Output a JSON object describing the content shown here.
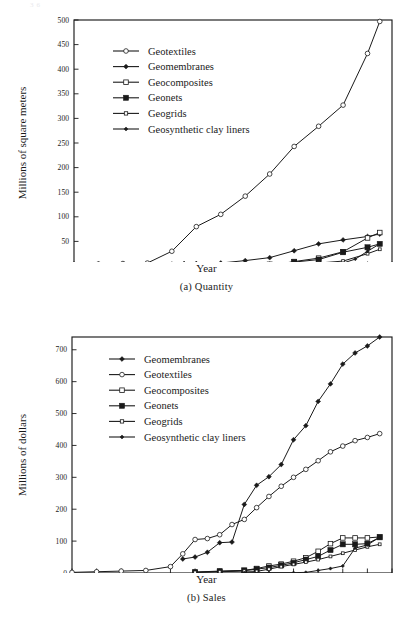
{
  "page": {
    "top_stub": "36",
    "background": "#ffffff",
    "ink": "#1a1a1a"
  },
  "figures": [
    {
      "id": "quantity",
      "caption": "(a)  Quantity",
      "xlabel": "Year",
      "ylabel": "Millions of square meters",
      "legend": [
        {
          "label": "Geotextiles",
          "marker": "open-circle",
          "size": 4.0
        },
        {
          "label": "Geomembranes",
          "marker": "filled-diamond",
          "size": 3.4
        },
        {
          "label": "Geocomposites",
          "marker": "open-square",
          "size": 3.8
        },
        {
          "label": "Geonets",
          "marker": "filled-square",
          "size": 4.2
        },
        {
          "label": "Geogrids",
          "marker": "open-square",
          "size": 2.8
        },
        {
          "label": "Geosynthetic clay liners",
          "marker": "filled-diamond",
          "size": 2.8
        }
      ],
      "chart_data": {
        "type": "line",
        "title": "(a)  Quantity",
        "xlabel": "Year",
        "ylabel": "Millions of square meters",
        "xlim": [
          1970,
          1996
        ],
        "ylim": [
          0,
          500
        ],
        "xticks": [
          1970,
          1972,
          1974,
          1976,
          1978,
          1980,
          1982,
          1984,
          1986,
          1988,
          1990,
          1992,
          1994,
          1996
        ],
        "yticks": [
          0,
          50,
          100,
          150,
          200,
          250,
          300,
          350,
          400,
          450,
          500
        ],
        "grid": false,
        "legend_position": "upper-left",
        "series": [
          {
            "name": "Geotextiles",
            "marker": "open-circle",
            "x": [
              1970,
              1972,
              1974,
              1976,
              1978,
              1980,
              1982,
              1984,
              1986,
              1988,
              1990,
              1992,
              1994,
              1995
            ],
            "y": [
              3,
              4,
              5,
              6,
              30,
              80,
              105,
              142,
              187,
              243,
              284,
              327,
              432,
              497
            ]
          },
          {
            "name": "Geomembranes",
            "marker": "filled-diamond",
            "x": [
              1979,
              1980,
              1982,
              1984,
              1986,
              1988,
              1990,
              1992,
              1994,
              1995
            ],
            "y": [
              5,
              5,
              6,
              11,
              17,
              31,
              45,
              53,
              60,
              65
            ]
          },
          {
            "name": "Geocomposites",
            "marker": "open-square",
            "x": [
              1985,
              1986,
              1988,
              1990,
              1992,
              1994,
              1995
            ],
            "y": [
              1,
              1,
              9,
              16,
              29,
              57,
              68
            ]
          },
          {
            "name": "Geonets",
            "marker": "filled-square",
            "x": [
              1985,
              1986,
              1988,
              1990,
              1992,
              1994,
              1995
            ],
            "y": [
              1,
              3,
              8,
              13,
              28,
              38,
              45
            ]
          },
          {
            "name": "Geogrids",
            "marker": "open-square-small",
            "x": [
              1985,
              1986,
              1988,
              1990,
              1992,
              1994,
              1995
            ],
            "y": [
              1,
              1,
              3,
              6,
              10,
              25,
              34
            ]
          },
          {
            "name": "Geosynthetic clay liners",
            "marker": "filled-diamond-small",
            "x": [
              1986,
              1988,
              1990,
              1992,
              1993,
              1994,
              1995
            ],
            "y": [
              1,
              1,
              2,
              6,
              14,
              30,
              45
            ]
          }
        ]
      }
    },
    {
      "id": "sales",
      "caption": "(b) Sales",
      "xlabel": "Year",
      "ylabel": "Millions of dollars",
      "legend": [
        {
          "label": "Geomembranes",
          "marker": "filled-diamond",
          "size": 3.4
        },
        {
          "label": "Geotextiles",
          "marker": "open-circle",
          "size": 4.0
        },
        {
          "label": "Geocomposites",
          "marker": "open-square",
          "size": 3.8
        },
        {
          "label": "Geonets",
          "marker": "filled-square",
          "size": 4.2
        },
        {
          "label": "Geogrids",
          "marker": "open-square",
          "size": 2.8
        },
        {
          "label": "Geosynthetic clay liners",
          "marker": "filled-diamond",
          "size": 2.8
        }
      ],
      "chart_data": {
        "type": "line",
        "title": "(b) Sales",
        "xlabel": "Year",
        "ylabel": "Millions of dollars",
        "xlim": [
          1970,
          1996
        ],
        "ylim": [
          0,
          740
        ],
        "xticks": [
          1970,
          1972,
          1974,
          1976,
          1978,
          1980,
          1982,
          1984,
          1986,
          1988,
          1990,
          1992,
          1994,
          1996
        ],
        "yticks": [
          0,
          100,
          200,
          300,
          400,
          500,
          600,
          700
        ],
        "grid": false,
        "legend_position": "upper-left",
        "series": [
          {
            "name": "Geomembranes",
            "marker": "filled-diamond",
            "x": [
              1979,
              1980,
              1981,
              1982,
              1983,
              1984,
              1985,
              1986,
              1987,
              1988,
              1989,
              1990,
              1991,
              1992,
              1993,
              1994,
              1995
            ],
            "y": [
              44,
              50,
              65,
              95,
              97,
              215,
              275,
              302,
              340,
              418,
              462,
              538,
              593,
              655,
              690,
              712,
              740
            ]
          },
          {
            "name": "Geotextiles",
            "marker": "open-circle",
            "x": [
              1970,
              1972,
              1974,
              1976,
              1978,
              1979,
              1980,
              1981,
              1982,
              1983,
              1984,
              1985,
              1986,
              1987,
              1988,
              1989,
              1990,
              1991,
              1992,
              1993,
              1994,
              1995
            ],
            "y": [
              2,
              4,
              6,
              8,
              20,
              60,
              105,
              108,
              120,
              152,
              168,
              205,
              240,
              272,
              300,
              325,
              352,
              380,
              398,
              415,
              425,
              437
            ]
          },
          {
            "name": "Geocomposites",
            "marker": "open-square",
            "x": [
              1980,
              1982,
              1984,
              1985,
              1986,
              1987,
              1988,
              1989,
              1990,
              1991,
              1992,
              1993,
              1994,
              1995
            ],
            "y": [
              3,
              6,
              8,
              14,
              22,
              28,
              37,
              48,
              68,
              92,
              110,
              110,
              110,
              113
            ]
          },
          {
            "name": "Geonets",
            "marker": "filled-square",
            "x": [
              1980,
              1982,
              1984,
              1985,
              1986,
              1987,
              1988,
              1989,
              1990,
              1991,
              1992,
              1993,
              1994,
              1995
            ],
            "y": [
              2,
              5,
              8,
              12,
              17,
              24,
              32,
              42,
              52,
              72,
              90,
              90,
              92,
              112
            ]
          },
          {
            "name": "Geogrids",
            "marker": "open-square-small",
            "x": [
              1980,
              1982,
              1984,
              1985,
              1986,
              1987,
              1988,
              1989,
              1990,
              1991,
              1992,
              1993,
              1994,
              1995
            ],
            "y": [
              2,
              4,
              6,
              5,
              12,
              20,
              27,
              34,
              42,
              52,
              62,
              72,
              82,
              90
            ]
          },
          {
            "name": "Geosynthetic clay liners",
            "marker": "filled-diamond-small",
            "x": [
              1984,
              1986,
              1988,
              1989,
              1990,
              1991,
              1992,
              1993,
              1994,
              1995
            ],
            "y": [
              1,
              1,
              1,
              2,
              8,
              14,
              22,
              78,
              88,
              112
            ]
          }
        ]
      }
    }
  ]
}
